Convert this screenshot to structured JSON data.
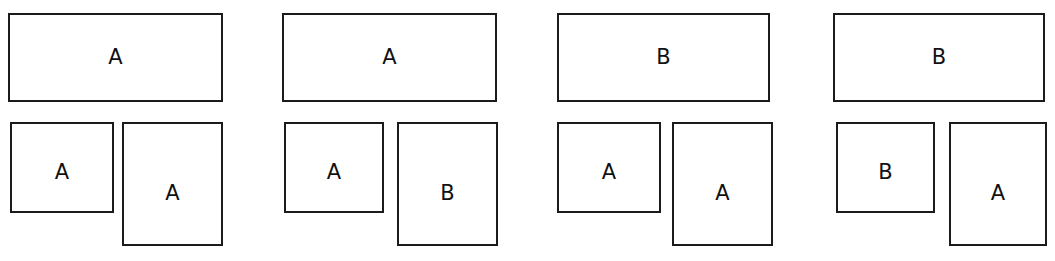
{
  "figure": {
    "type": "diagram",
    "group_count": 4,
    "boxes_per_group": 3,
    "stroke_color": "#1b1b1b",
    "fill_color": "#ffffff",
    "text_color": "#111111"
  },
  "groups": [
    {
      "id": "group-1",
      "left": 8,
      "boxes": {
        "top": {
          "label": "A",
          "left": 0,
          "width": 215
        },
        "bottom_left": {
          "label": "A",
          "left": 2,
          "width": 104
        },
        "bottom_right": {
          "label": "A",
          "left": 114,
          "width": 101
        }
      }
    },
    {
      "id": "group-2",
      "left": 282,
      "boxes": {
        "top": {
          "label": "A",
          "left": 0,
          "width": 215
        },
        "bottom_left": {
          "label": "A",
          "left": 2,
          "width": 100
        },
        "bottom_right": {
          "label": "B",
          "left": 115,
          "width": 101
        }
      }
    },
    {
      "id": "group-3",
      "left": 557,
      "boxes": {
        "top": {
          "label": "B",
          "left": 0,
          "width": 213
        },
        "bottom_left": {
          "label": "A",
          "left": 0,
          "width": 104
        },
        "bottom_right": {
          "label": "A",
          "left": 115,
          "width": 101
        }
      }
    },
    {
      "id": "group-4",
      "left": 833,
      "boxes": {
        "top": {
          "label": "B",
          "left": 0,
          "width": 212
        },
        "bottom_left": {
          "label": "B",
          "left": 3,
          "width": 99
        },
        "bottom_right": {
          "label": "A",
          "left": 116,
          "width": 98
        }
      }
    }
  ]
}
